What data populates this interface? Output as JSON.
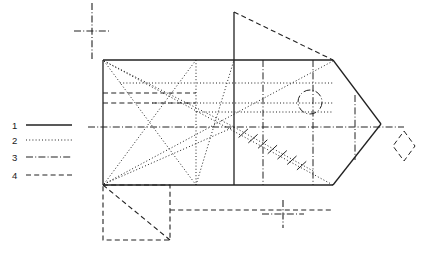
{
  "figure": {
    "kind": "engineering-line-drawing",
    "width": 424,
    "height": 255,
    "background_color": "#ffffff",
    "stroke_color": "#222222"
  },
  "legend": {
    "name": "line-type-legend",
    "position": "left",
    "items": [
      {
        "key": "1",
        "label": "1",
        "style": "solid",
        "dasharray": ""
      },
      {
        "key": "2",
        "label": "2",
        "style": "dotted",
        "dasharray": "1,2.2"
      },
      {
        "key": "3",
        "label": "3",
        "style": "dash-dot",
        "dasharray": "7,2.2,1,2.2"
      },
      {
        "key": "4",
        "label": "4",
        "style": "dashed",
        "dasharray": "5,3.2"
      }
    ],
    "sample": {
      "x1": 26,
      "x2": 72,
      "rows_y": [
        125,
        140,
        157,
        175
      ]
    }
  },
  "chart_data": {
    "type": "table",
    "title": "",
    "xlabel": "",
    "ylabel": "",
    "categories": [
      "1",
      "2",
      "3",
      "4"
    ],
    "values": [
      "solid",
      "dotted",
      "dash-dot",
      "dashed"
    ]
  },
  "geometry": {
    "body": {
      "name": "main-rectangle",
      "x": 103,
      "y": 60,
      "width": 230,
      "height": 125
    },
    "solid_lines": [
      {
        "name": "body-top-edge",
        "x1": 103,
        "y1": 60,
        "x2": 333,
        "y2": 60
      },
      {
        "name": "body-bottom-edge",
        "x1": 103,
        "y1": 185,
        "x2": 333,
        "y2": 185
      },
      {
        "name": "body-left-edge",
        "x1": 103,
        "y1": 60,
        "x2": 103,
        "y2": 185
      },
      {
        "name": "nose-upper-edge",
        "x1": 333,
        "y1": 60,
        "x2": 381,
        "y2": 124
      },
      {
        "name": "nose-lower-edge",
        "x1": 333,
        "y1": 185,
        "x2": 381,
        "y2": 124
      },
      {
        "name": "center-vertical-rib",
        "x1": 234,
        "y1": 12,
        "x2": 234,
        "y2": 185
      }
    ],
    "dotted_lines": [
      {
        "name": "diag-topleft-to-apex",
        "x1": 104,
        "y1": 61,
        "x2": 333,
        "y2": 185
      },
      {
        "name": "diag-bottomleft-to-top-rib",
        "x1": 104,
        "y1": 184,
        "x2": 333,
        "y2": 61
      },
      {
        "name": "diag-topleft-to-mid",
        "x1": 104,
        "y1": 61,
        "x2": 234,
        "y2": 127
      },
      {
        "name": "diag-bottomleft-to-mid",
        "x1": 104,
        "y1": 184,
        "x2": 234,
        "y2": 127
      },
      {
        "name": "fan-topleft-to-lower-mid",
        "x1": 104,
        "y1": 61,
        "x2": 196,
        "y2": 185
      },
      {
        "name": "fan-bottomleft-to-upper-mid",
        "x1": 104,
        "y1": 184,
        "x2": 196,
        "y2": 60
      },
      {
        "name": "chord-mid-to-upper-right",
        "x1": 196,
        "y1": 185,
        "x2": 234,
        "y2": 60
      },
      {
        "name": "horiz-dotted-upper",
        "x1": 120,
        "y1": 83,
        "x2": 333,
        "y2": 83
      },
      {
        "name": "horiz-dotted-mid",
        "x1": 152,
        "y1": 103,
        "x2": 333,
        "y2": 103
      },
      {
        "name": "horiz-dotted-lower",
        "x1": 196,
        "y1": 112,
        "x2": 333,
        "y2": 112
      },
      {
        "name": "vert-dotted-rib",
        "x1": 196,
        "y1": 60,
        "x2": 196,
        "y2": 185
      },
      {
        "name": "hatched-diagonal",
        "x1": 234,
        "y1": 127,
        "x2": 315,
        "y2": 172
      }
    ],
    "dashed_lines": [
      {
        "name": "horiz-dashed-upper",
        "x1": 103,
        "y1": 93,
        "x2": 196,
        "y2": 93
      },
      {
        "name": "horiz-dashed-lower",
        "x1": 103,
        "y1": 103,
        "x2": 196,
        "y2": 103
      },
      {
        "name": "roof-apex-diagonal",
        "x1": 234,
        "y1": 12,
        "x2": 333,
        "y2": 60
      },
      {
        "name": "lower-dashed-offset-rail",
        "x1": 170,
        "y1": 210,
        "x2": 333,
        "y2": 210
      }
    ],
    "dashdot_lines": [
      {
        "name": "horizontal-centerline",
        "x1": 88,
        "y1": 127,
        "x2": 404,
        "y2": 127
      },
      {
        "name": "vert-centerline-left",
        "x1": 263,
        "y1": 60,
        "x2": 263,
        "y2": 185
      },
      {
        "name": "vert-centerline-right",
        "x1": 313,
        "y1": 60,
        "x2": 313,
        "y2": 185
      },
      {
        "name": "vert-centerline-nose",
        "x1": 355,
        "y1": 95,
        "x2": 355,
        "y2": 160
      }
    ],
    "circle": {
      "name": "bore-circle",
      "cx": 310,
      "cy": 102,
      "r": 12,
      "style": "dash-dot"
    },
    "diamond": {
      "name": "detail-diamond",
      "cx": 404,
      "cy": 146,
      "rx": 11,
      "ry": 15,
      "style": "dashed"
    },
    "corner_box": {
      "name": "lower-left-dashed-box",
      "x": 103,
      "y": 185,
      "width": 67,
      "height": 55,
      "diagonal": {
        "x1": 103,
        "y1": 185,
        "x2": 170,
        "y2": 240
      }
    },
    "crosshairs": [
      {
        "name": "crosshair-upper-left",
        "cx": 92,
        "cy": 31,
        "arm_h": 18,
        "arm_v": 28
      },
      {
        "name": "crosshair-lower-mid",
        "cx": 283,
        "cy": 214,
        "arm_h": 21,
        "arm_v": 14
      }
    ],
    "hatch_marks": {
      "name": "hatch-tick-group",
      "count": 7,
      "length": 12,
      "along": "hatched-diagonal"
    }
  }
}
